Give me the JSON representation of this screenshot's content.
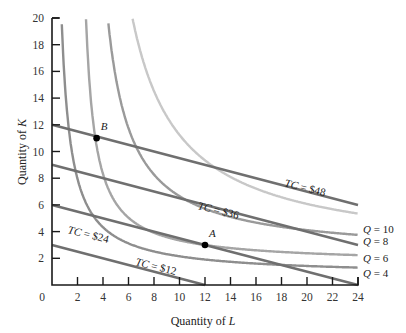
{
  "chart_data": {
    "type": "line",
    "title": "",
    "xlabel": "Quantity of L",
    "ylabel": "Quantity of K",
    "xlim": [
      0,
      24
    ],
    "ylim": [
      0,
      20
    ],
    "grid": false,
    "x_ticks": [
      2,
      4,
      6,
      8,
      10,
      12,
      14,
      16,
      18,
      20,
      22,
      24
    ],
    "y_ticks": [
      2,
      4,
      6,
      8,
      10,
      12,
      14,
      16,
      18,
      20
    ],
    "origin_label": "0",
    "isocost_lines": [
      {
        "name": "TC = $12",
        "k_intercept": 3,
        "l_intercept": 12,
        "points": [
          [
            0,
            3
          ],
          [
            12,
            0
          ]
        ]
      },
      {
        "name": "TC = $24",
        "k_intercept": 6,
        "l_intercept": 24,
        "points": [
          [
            0,
            6
          ],
          [
            24,
            0
          ]
        ]
      },
      {
        "name": "TC = $36",
        "k_intercept": 9,
        "points": [
          [
            0,
            9
          ],
          [
            24,
            3
          ]
        ]
      },
      {
        "name": "TC = $48",
        "k_intercept": 12,
        "points": [
          [
            0,
            12
          ],
          [
            24,
            6
          ]
        ]
      }
    ],
    "isoquants": [
      {
        "name": "Q = 4",
        "form": "K = c + a/(L - b)",
        "c": 0.7,
        "a": 14.5,
        "b": 0.0,
        "end_K_at_24": 1.3,
        "color": "#8e8e8e"
      },
      {
        "name": "Q = 6",
        "form": "K = c + a/(L - b)",
        "c": 1.6,
        "a": 14.1,
        "b": 1.9,
        "end_K_at_24": 2.2,
        "color": "#a5a5a5"
      },
      {
        "name": "Q = 8",
        "form": "K = c + a/(L - b)",
        "c": 2.2,
        "a": 33.4,
        "b": 2.5,
        "end_K_at_24": 3.7,
        "color": "#9a9a9a"
      },
      {
        "name": "Q = 10",
        "form": "K = c + a/(L - b)",
        "c": 2.2,
        "a": 67.8,
        "b": 2.5,
        "end_K_at_24": 5.3,
        "color": "#c8c8c8"
      }
    ],
    "points": [
      {
        "label": "A",
        "L": 12,
        "K": 3
      },
      {
        "label": "B",
        "L": 3.5,
        "K": 11
      }
    ],
    "annotations": [
      {
        "text": "TC = $12",
        "L": 6.5,
        "K": 1.5,
        "angle": 14
      },
      {
        "text": "TC = $24",
        "L": 1.2,
        "K": 3.9,
        "angle": 14
      },
      {
        "text": "TC = $36",
        "L": 11.4,
        "K": 5.7,
        "angle": 14
      },
      {
        "text": "TC = $48",
        "L": 18.2,
        "K": 7.4,
        "angle": 14
      }
    ],
    "isoquant_labels": [
      {
        "text": "Q = 10",
        "K": 4.2
      },
      {
        "text": "Q = 8",
        "K": 3.3
      },
      {
        "text": "Q = 6",
        "K": 2.0
      },
      {
        "text": "Q = 4",
        "K": 0.9
      }
    ]
  }
}
